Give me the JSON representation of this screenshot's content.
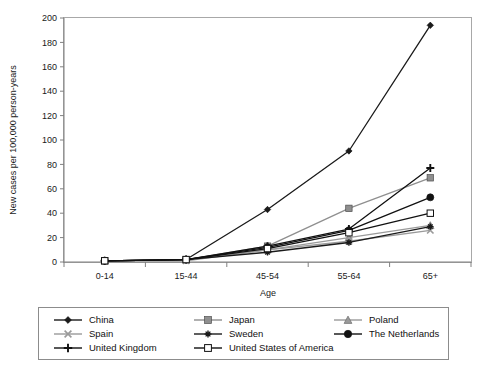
{
  "chart_data": {
    "type": "line",
    "title": "",
    "xlabel": "Age",
    "ylabel": "New cases per 100,000 person-years",
    "categories": [
      "0-14",
      "15-44",
      "45-54",
      "55-64",
      "65+"
    ],
    "ylim": [
      0,
      200
    ],
    "yticks": [
      0,
      20,
      40,
      60,
      80,
      100,
      120,
      140,
      160,
      180,
      200
    ],
    "grid": false,
    "legend_position": "bottom",
    "series": [
      {
        "name": "China",
        "marker": "filled-diamond",
        "color": "#1a1a1a",
        "values": [
          1,
          2,
          43,
          91,
          194
        ]
      },
      {
        "name": "Japan",
        "marker": "filled-square",
        "color": "#8f8f8f",
        "values": [
          1,
          2,
          13,
          44,
          69
        ]
      },
      {
        "name": "Poland",
        "marker": "filled-triangle",
        "color": "#9a9a9a",
        "values": [
          1,
          2,
          10,
          20,
          30
        ]
      },
      {
        "name": "Spain",
        "marker": "cross-x",
        "color": "#9a9a9a",
        "values": [
          1,
          1,
          10,
          17,
          26
        ]
      },
      {
        "name": "Sweden",
        "marker": "asterisk",
        "color": "#1a1a1a",
        "values": [
          1,
          2,
          8,
          16,
          29
        ]
      },
      {
        "name": "The Netherlands",
        "marker": "filled-circle",
        "color": "#111111",
        "values": [
          1,
          2,
          12,
          26,
          53
        ]
      },
      {
        "name": "United Kingdom",
        "marker": "plus",
        "color": "#111111",
        "values": [
          1,
          2,
          13,
          27,
          77
        ]
      },
      {
        "name": "United States of America",
        "marker": "hollow-square",
        "color": "#111111",
        "values": [
          1,
          2,
          11,
          24,
          40
        ]
      }
    ]
  },
  "legend": {
    "entries": [
      {
        "label": "China"
      },
      {
        "label": "Japan"
      },
      {
        "label": "Poland"
      },
      {
        "label": "Spain"
      },
      {
        "label": "Sweden"
      },
      {
        "label": "The Netherlands"
      },
      {
        "label": "United Kingdom"
      },
      {
        "label": "United States of America"
      }
    ]
  }
}
